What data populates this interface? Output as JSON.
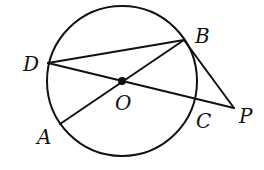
{
  "figure": {
    "type": "geometry",
    "colors": {
      "ink": "#111111",
      "background": "#ffffff"
    },
    "circle": {
      "center": "O",
      "cx": 122,
      "cy": 81,
      "r": 75
    },
    "points": {
      "O": {
        "x": 122,
        "y": 81,
        "label": "O",
        "label_x": 115,
        "label_y": 110
      },
      "A": {
        "x": 60,
        "y": 124,
        "label": "A",
        "label_x": 37,
        "label_y": 144
      },
      "B": {
        "x": 184,
        "y": 40,
        "label": "B",
        "label_x": 195,
        "label_y": 43
      },
      "C": {
        "x": 197,
        "y": 100,
        "label": "C",
        "label_x": 196,
        "label_y": 128
      },
      "D": {
        "x": 48,
        "y": 63,
        "label": "D",
        "label_x": 23,
        "label_y": 71
      },
      "P": {
        "x": 234,
        "y": 108,
        "label": "P",
        "label_x": 239,
        "label_y": 123
      }
    },
    "segments": [
      {
        "from": "D",
        "to": "B",
        "name": "chord-db"
      },
      {
        "from": "A",
        "to": "B",
        "name": "diameter-ab"
      },
      {
        "from": "D",
        "to": "P",
        "name": "secant-dp"
      },
      {
        "from": "B",
        "to": "P",
        "name": "segment-bp"
      }
    ]
  }
}
